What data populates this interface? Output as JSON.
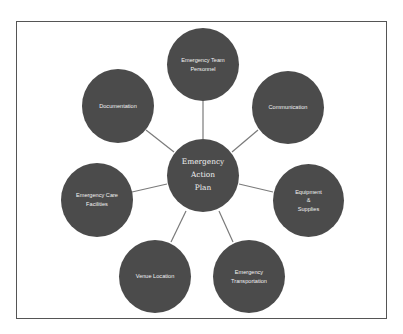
{
  "diagram": {
    "type": "hub-and-spoke",
    "colors": {
      "node_fill": "#4b4b4b",
      "node_text": "#f2f2f2",
      "link": "#7a7a7a",
      "frame": "#555555"
    },
    "center": {
      "label": "Emergency\nAction\nPlan"
    },
    "nodes": [
      {
        "id": "team",
        "label": "Emergency Team\nPersonnel"
      },
      {
        "id": "communication",
        "label": "Communication"
      },
      {
        "id": "equipment",
        "label": "Equipment\n&\nSupplies"
      },
      {
        "id": "transportation",
        "label": "Emergency\nTransportation"
      },
      {
        "id": "venue",
        "label": "Venue Location"
      },
      {
        "id": "care",
        "label": "Emergency Care\nFacilities"
      },
      {
        "id": "documentation",
        "label": "Documentation"
      }
    ]
  }
}
